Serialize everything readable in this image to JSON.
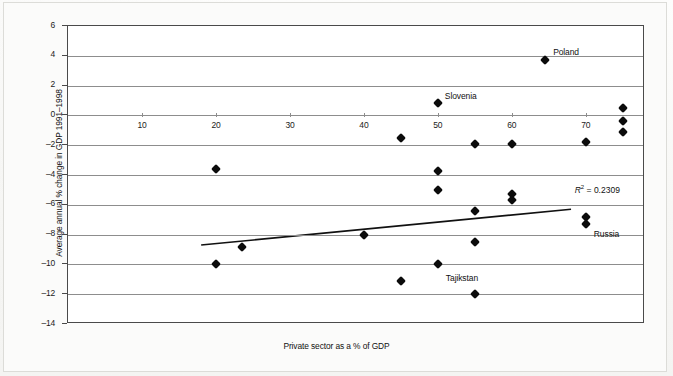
{
  "chart_data": {
    "type": "scatter",
    "title": "",
    "xlabel": "Private sector as a % of GDP",
    "ylabel": "Average annual % change in GDP 1991–1998",
    "xlim": [
      0,
      78
    ],
    "ylim": [
      -14,
      6
    ],
    "xticks": [
      10,
      20,
      30,
      40,
      50,
      60,
      70
    ],
    "yticks": [
      6,
      4,
      2,
      0,
      -2,
      -4,
      -6,
      -8,
      -10,
      -12,
      -14
    ],
    "grid": "horizontal",
    "legend": "none",
    "annotations": [
      {
        "name": "r-squared",
        "text": "R² = 0.2309",
        "symbol": "R",
        "sup": "2",
        "rest": " = 0.2309"
      }
    ],
    "trendline": {
      "x0": 18,
      "y0": -8.7,
      "x1": 68,
      "y1": -6.3
    },
    "points": [
      {
        "x": 20.0,
        "y": -3.6,
        "label": ""
      },
      {
        "x": 20.0,
        "y": -10.0,
        "label": ""
      },
      {
        "x": 23.5,
        "y": -8.8,
        "label": ""
      },
      {
        "x": 40.0,
        "y": -8.0,
        "label": ""
      },
      {
        "x": 45.0,
        "y": -1.5,
        "label": ""
      },
      {
        "x": 45.0,
        "y": -11.1,
        "label": ""
      },
      {
        "x": 50.0,
        "y": 0.8,
        "label": "Slovenia"
      },
      {
        "x": 50.0,
        "y": -3.7,
        "label": ""
      },
      {
        "x": 50.0,
        "y": -5.0,
        "label": ""
      },
      {
        "x": 50.0,
        "y": -10.0,
        "label": "Tajikstan"
      },
      {
        "x": 55.0,
        "y": -1.9,
        "label": ""
      },
      {
        "x": 55.0,
        "y": -6.4,
        "label": ""
      },
      {
        "x": 55.0,
        "y": -8.5,
        "label": ""
      },
      {
        "x": 55.0,
        "y": -12.0,
        "label": ""
      },
      {
        "x": 60.0,
        "y": -1.9,
        "label": ""
      },
      {
        "x": 60.0,
        "y": -5.3,
        "label": ""
      },
      {
        "x": 60.0,
        "y": -5.7,
        "label": ""
      },
      {
        "x": 64.5,
        "y": 3.7,
        "label": "Poland"
      },
      {
        "x": 70.0,
        "y": -1.8,
        "label": ""
      },
      {
        "x": 70.0,
        "y": -6.8,
        "label": ""
      },
      {
        "x": 70.0,
        "y": -7.3,
        "label": "Russia"
      },
      {
        "x": 75.0,
        "y": 0.5,
        "label": ""
      },
      {
        "x": 75.0,
        "y": -0.4,
        "label": ""
      },
      {
        "x": 75.0,
        "y": -1.1,
        "label": ""
      }
    ],
    "point_labels": [
      {
        "text": "Poland",
        "x": 64.5,
        "y": 3.7,
        "dx": 8,
        "dy": -13
      },
      {
        "text": "Slovenia",
        "x": 50.0,
        "y": 0.8,
        "dx": 7,
        "dy": -12
      },
      {
        "text": "Tajikstan",
        "x": 50.0,
        "y": -10.0,
        "dx": 8,
        "dy": 9
      },
      {
        "text": "Russia",
        "x": 70.0,
        "y": -7.3,
        "dx": 8,
        "dy": 5
      }
    ],
    "colors": {
      "marker": "#0b0b0b",
      "gridline": "#8d8d8d",
      "axis": "#4a4a4a",
      "trendline": "#111111",
      "plot_background": "#ffffff",
      "page_background": "#fbfbfa"
    }
  }
}
